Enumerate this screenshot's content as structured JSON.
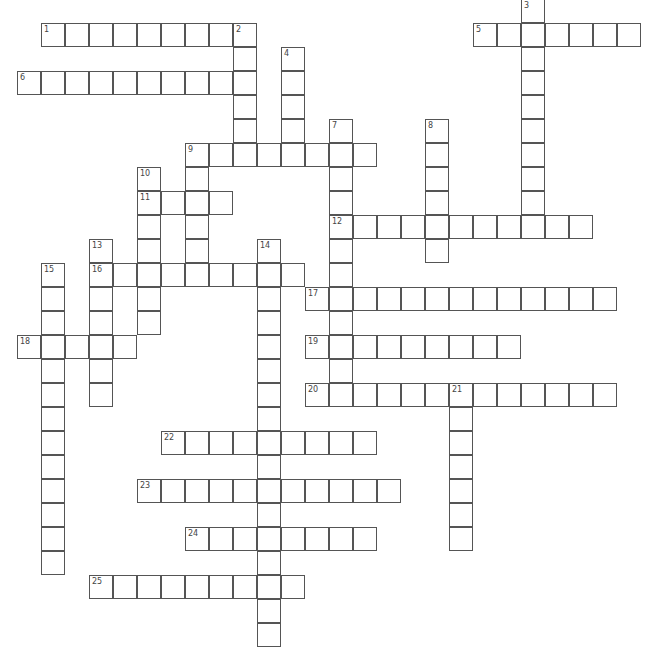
{
  "puzzle": {
    "cell_size": 24,
    "origin_x": 17,
    "origin_y": -1,
    "line_color": "#555555",
    "number_color": "#444444",
    "background": "#ffffff"
  },
  "words": [
    {
      "number": 1,
      "direction": "across",
      "row": 1,
      "col": 1,
      "length": 9
    },
    {
      "number": 2,
      "direction": "down",
      "row": 1,
      "col": 9,
      "length": 5
    },
    {
      "number": 3,
      "direction": "down",
      "row": 0,
      "col": 21,
      "length": 10
    },
    {
      "number": 4,
      "direction": "down",
      "row": 2,
      "col": 11,
      "length": 5
    },
    {
      "number": 5,
      "direction": "across",
      "row": 1,
      "col": 19,
      "length": 7
    },
    {
      "number": 6,
      "direction": "across",
      "row": 3,
      "col": 0,
      "length": 10
    },
    {
      "number": 7,
      "direction": "down",
      "row": 5,
      "col": 13,
      "length": 12
    },
    {
      "number": 8,
      "direction": "down",
      "row": 5,
      "col": 17,
      "length": 6
    },
    {
      "number": 9,
      "direction": "across",
      "row": 6,
      "col": 7,
      "length": 8
    },
    {
      "number": 9,
      "direction": "down",
      "row": 6,
      "col": 7,
      "length": 6
    },
    {
      "number": 10,
      "direction": "down",
      "row": 7,
      "col": 5,
      "length": 7
    },
    {
      "number": 11,
      "direction": "across",
      "row": 8,
      "col": 5,
      "length": 4
    },
    {
      "number": 12,
      "direction": "across",
      "row": 9,
      "col": 13,
      "length": 11
    },
    {
      "number": 13,
      "direction": "down",
      "row": 10,
      "col": 3,
      "length": 7
    },
    {
      "number": 14,
      "direction": "down",
      "row": 10,
      "col": 10,
      "length": 17
    },
    {
      "number": 15,
      "direction": "down",
      "row": 11,
      "col": 1,
      "length": 13
    },
    {
      "number": 16,
      "direction": "across",
      "row": 11,
      "col": 3,
      "length": 9
    },
    {
      "number": 17,
      "direction": "across",
      "row": 12,
      "col": 12,
      "length": 13
    },
    {
      "number": 18,
      "direction": "across",
      "row": 14,
      "col": 0,
      "length": 5
    },
    {
      "number": 19,
      "direction": "across",
      "row": 14,
      "col": 12,
      "length": 9
    },
    {
      "number": 20,
      "direction": "across",
      "row": 16,
      "col": 12,
      "length": 13
    },
    {
      "number": 21,
      "direction": "down",
      "row": 16,
      "col": 18,
      "length": 7
    },
    {
      "number": 22,
      "direction": "across",
      "row": 18,
      "col": 6,
      "length": 9
    },
    {
      "number": 23,
      "direction": "across",
      "row": 20,
      "col": 5,
      "length": 11
    },
    {
      "number": 24,
      "direction": "across",
      "row": 22,
      "col": 7,
      "length": 8
    },
    {
      "number": 25,
      "direction": "across",
      "row": 24,
      "col": 3,
      "length": 9
    }
  ]
}
